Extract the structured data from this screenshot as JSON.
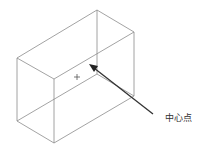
{
  "diagram": {
    "type": "isometric-box-wireframe",
    "line_color": "#8c8c8c",
    "arrow_color": "#333333",
    "vertices": {
      "top_back": [
        97,
        10
      ],
      "right_top": [
        134,
        32
      ],
      "left_top": [
        17,
        58
      ],
      "front_top": [
        54,
        79
      ],
      "left_bottom": [
        17,
        121
      ],
      "front_bottom": [
        54,
        143
      ],
      "right_bottom": [
        134,
        96
      ],
      "hidden_bottom": [
        97,
        74
      ]
    },
    "center_marker": {
      "symbol": "+",
      "x": 77,
      "y": 77
    },
    "arrow": {
      "from": [
        153,
        114
      ],
      "to": [
        90,
        65
      ]
    },
    "label": {
      "text": "中心点",
      "x": 165,
      "y": 111
    }
  }
}
